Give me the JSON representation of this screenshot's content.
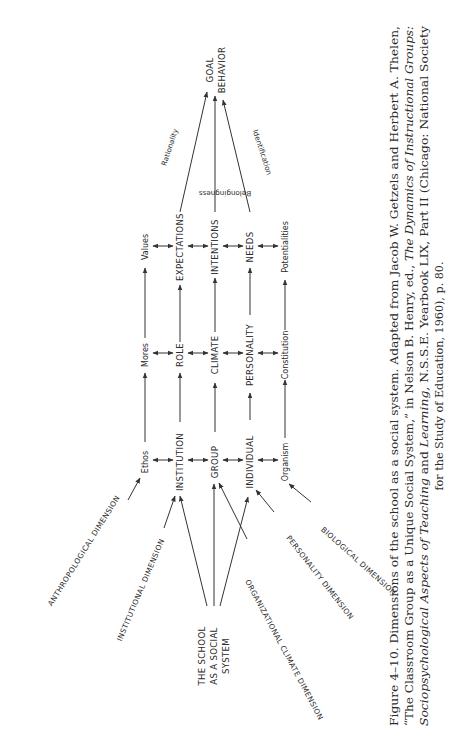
{
  "diagram": {
    "orientation": "rotated 90deg counterclockwise on page",
    "source": {
      "label": "THE SCHOOL AS A SOCIAL SYSTEM",
      "lines": [
        "THE SCHOOL",
        "AS A SOCIAL",
        "SYSTEM"
      ]
    },
    "goal": {
      "label": "GOAL BEHAVIOR",
      "lines": [
        "GOAL",
        "BEHAVIOR"
      ]
    },
    "dimensions": [
      {
        "id": "anthropological",
        "label": "ANTHROPOLOGICAL DIMENSION",
        "column": "ethos"
      },
      {
        "id": "institutional",
        "label": "INSTITUTIONAL DIMENSION",
        "column": "institution"
      },
      {
        "id": "organizational-climate",
        "label": "ORGANIZATIONAL CLIMATE DIMENSION",
        "column": "group"
      },
      {
        "id": "personality",
        "label": "PERSONALITY DIMENSION",
        "column": "individual"
      },
      {
        "id": "biological",
        "label": "BIOLOGICAL DIMENSION",
        "column": "organism"
      }
    ],
    "columns": [
      {
        "id": "ethos",
        "row1": "Ethos",
        "row2": "Mores",
        "row3": "Values"
      },
      {
        "id": "institution",
        "row1": "INSTITUTION",
        "row2": "ROLE",
        "row3": "EXPECTATIONS"
      },
      {
        "id": "group",
        "row1": "GROUP",
        "row2": "CLIMATE",
        "row3": "INTENTIONS"
      },
      {
        "id": "individual",
        "row1": "INDIVIDUAL",
        "row2": "PERSONALITY",
        "row3": "NEEDS"
      },
      {
        "id": "organism",
        "row1": "Organism",
        "row2": "Constitution",
        "row3": "Potentialities"
      }
    ],
    "edge_labels": {
      "rationality": "Rationality",
      "belongingness": "Belongingness",
      "identification": "Identification"
    }
  },
  "caption": {
    "figure_label": "Figure 4–10.",
    "lines": [
      {
        "text": "Figure 4–10.  Dimensions of the school as a social system. Adapted from Jacob W. Getzels and Herbert A. Thelen,"
      },
      {
        "text": "“The Classroom Group as a Unique Social System,” in Nelson B. Henry, ed., The Dynamics of Instructional Groups:"
      },
      {
        "text": "Sociopsychological Aspects of Teaching and Learning, N.S.S.E. Yearbook LIX, Part II (Chicago: National Society"
      },
      {
        "text": "for the Study of Education, 1960), p. 80."
      }
    ],
    "line1": "Figure 4–10.  Dimensions of the school as a social system. Adapted from Jacob W. Getzels and Herbert A. Thelen,",
    "line2_a": "“The Classroom Group as a Unique Social System,” in Nelson B. Henry, ed., ",
    "line2_b": "The Dynamics of Instructional Groups:",
    "line3_a": "Sociopsychological Aspects of Teaching ",
    "line3_b": "and ",
    "line3_c": "Learning,",
    "line3_d": " N.S.S.E. Yearbook LIX, Part II (Chicago: National Society",
    "line4": "for the Study of Education, 1960), p. 80."
  }
}
